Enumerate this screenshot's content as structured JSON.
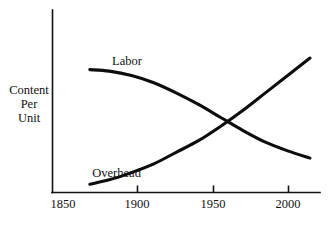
{
  "chart_data": {
    "type": "line",
    "title": "",
    "subtitle": "",
    "xlabel": "",
    "ylabel": "Content Per Unit",
    "ylabel_lines": [
      "Content",
      "Per",
      "Unit"
    ],
    "xlim": [
      1850,
      2010
    ],
    "ylim": [
      0,
      100
    ],
    "xticks": [
      1850,
      1900,
      1950,
      2000
    ],
    "xticklabels": [
      "1850",
      "1900",
      "1950",
      "2000"
    ],
    "yticks": [],
    "yticklabels": [],
    "grid": false,
    "legend": "inline-labels",
    "annotations": [
      {
        "text": "Labor",
        "x": 1887,
        "y": 86
      },
      {
        "text": "Overhead",
        "x": 1880,
        "y": 9
      }
    ],
    "series": [
      {
        "name": "Labor",
        "color": "#0d0d0d",
        "x": [
          1862,
          1875,
          1890,
          1905,
          1920,
          1935,
          1950,
          1965,
          1980,
          1995,
          2010
        ],
        "values": [
          83,
          82,
          79,
          74,
          67,
          59,
          50,
          41,
          33,
          27,
          22
        ]
      },
      {
        "name": "Overhead",
        "color": "#0d0d0d",
        "x": [
          1862,
          1875,
          1890,
          1905,
          1920,
          1935,
          1950,
          1965,
          1980,
          1995,
          2010
        ],
        "values": [
          4,
          7,
          12,
          18,
          26,
          34,
          44,
          55,
          67,
          79,
          91
        ]
      }
    ]
  },
  "axes": {
    "y_axis_name": "y-axis",
    "x_axis_name": "x-axis"
  }
}
